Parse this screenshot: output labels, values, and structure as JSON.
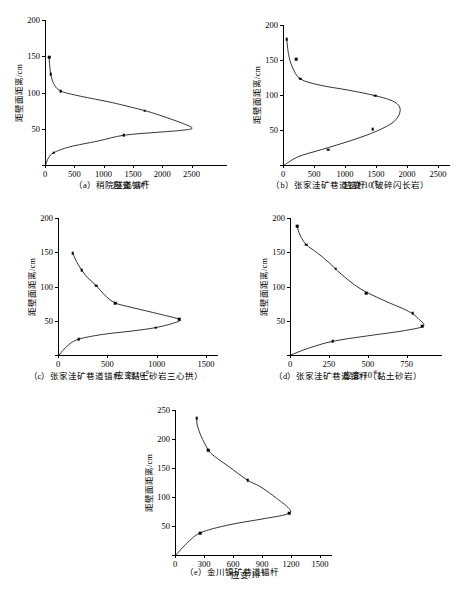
{
  "figure": {
    "axis_title_x": "应变/10",
    "axis_title_x_exp": "-6",
    "axis_title_y": "距壁面距离/cm"
  },
  "chart_data": [
    {
      "id": "a",
      "type": "scatter",
      "title": "",
      "caption": "（a）稍院隧道锚杆",
      "xlabel": "应变/10⁻⁶",
      "ylabel": "距壁面距离/cm",
      "xlim": [
        0,
        2900
      ],
      "ylim": [
        0,
        200
      ],
      "xticks": [
        0,
        500,
        1000,
        1500,
        2000,
        2500
      ],
      "yticks": [
        0,
        50,
        100,
        150,
        200
      ],
      "grid": false,
      "legend": "none",
      "points": [
        {
          "x": 70,
          "y": 149
        },
        {
          "x": 100,
          "y": 125
        },
        {
          "x": 270,
          "y": 102
        },
        {
          "x": 1700,
          "y": 75
        },
        {
          "x": 1340,
          "y": 41
        },
        {
          "x": 150,
          "y": 17
        }
      ],
      "curve": [
        {
          "x": 10,
          "y": 0
        },
        {
          "x": 60,
          "y": 10
        },
        {
          "x": 150,
          "y": 17
        },
        {
          "x": 420,
          "y": 25
        },
        {
          "x": 900,
          "y": 33
        },
        {
          "x": 1340,
          "y": 41
        },
        {
          "x": 1900,
          "y": 45
        },
        {
          "x": 2350,
          "y": 48
        },
        {
          "x": 2510,
          "y": 51
        },
        {
          "x": 2330,
          "y": 58
        },
        {
          "x": 1980,
          "y": 68
        },
        {
          "x": 1700,
          "y": 75
        },
        {
          "x": 1150,
          "y": 86
        },
        {
          "x": 600,
          "y": 95
        },
        {
          "x": 270,
          "y": 102
        },
        {
          "x": 150,
          "y": 112
        },
        {
          "x": 100,
          "y": 125
        },
        {
          "x": 80,
          "y": 137
        },
        {
          "x": 70,
          "y": 149
        }
      ]
    },
    {
      "id": "b",
      "type": "scatter",
      "title": "",
      "caption": "（b）张家洼矿巷道锚杆（破碎闪长岩）",
      "xlabel": "应变/10⁻⁶",
      "ylabel": "距壁面距离/cm",
      "xlim": [
        0,
        2500
      ],
      "ylim": [
        0,
        200
      ],
      "xticks": [
        0,
        500,
        1000,
        1500,
        2000,
        2500
      ],
      "yticks": [
        0,
        50,
        100,
        150,
        200
      ],
      "grid": false,
      "legend": "none",
      "points": [
        {
          "x": 60,
          "y": 180
        },
        {
          "x": 210,
          "y": 151
        },
        {
          "x": 280,
          "y": 123
        },
        {
          "x": 1490,
          "y": 99
        },
        {
          "x": 1450,
          "y": 51
        },
        {
          "x": 730,
          "y": 22
        }
      ],
      "curve": [
        {
          "x": 20,
          "y": 0
        },
        {
          "x": 250,
          "y": 12
        },
        {
          "x": 620,
          "y": 22
        },
        {
          "x": 1100,
          "y": 35
        },
        {
          "x": 1500,
          "y": 48
        },
        {
          "x": 1790,
          "y": 62
        },
        {
          "x": 1890,
          "y": 78
        },
        {
          "x": 1800,
          "y": 90
        },
        {
          "x": 1490,
          "y": 99
        },
        {
          "x": 1050,
          "y": 107
        },
        {
          "x": 600,
          "y": 114
        },
        {
          "x": 280,
          "y": 123
        },
        {
          "x": 150,
          "y": 140
        },
        {
          "x": 90,
          "y": 158
        },
        {
          "x": 60,
          "y": 180
        }
      ]
    },
    {
      "id": "c",
      "type": "scatter",
      "title": "",
      "caption": "（c）张家洼矿巷道锚杆（黏土砂岩三心拱）",
      "xlabel": "应变/10⁻⁶",
      "ylabel": "距壁面距离/cm",
      "xlim": [
        0,
        1500
      ],
      "ylim": [
        0,
        200
      ],
      "xticks": [
        0,
        500,
        1000,
        1500
      ],
      "yticks": [
        0,
        50,
        100,
        150,
        200
      ],
      "grid": false,
      "legend": "none",
      "points": [
        {
          "x": 150,
          "y": 149
        },
        {
          "x": 240,
          "y": 124
        },
        {
          "x": 390,
          "y": 101
        },
        {
          "x": 580,
          "y": 76
        },
        {
          "x": 1230,
          "y": 52
        },
        {
          "x": 990,
          "y": 40
        },
        {
          "x": 210,
          "y": 23
        }
      ],
      "curve": [
        {
          "x": 10,
          "y": 0
        },
        {
          "x": 100,
          "y": 14
        },
        {
          "x": 210,
          "y": 23
        },
        {
          "x": 450,
          "y": 30
        },
        {
          "x": 750,
          "y": 35
        },
        {
          "x": 990,
          "y": 40
        },
        {
          "x": 1180,
          "y": 47
        },
        {
          "x": 1230,
          "y": 52
        },
        {
          "x": 1020,
          "y": 60
        },
        {
          "x": 760,
          "y": 69
        },
        {
          "x": 580,
          "y": 76
        },
        {
          "x": 470,
          "y": 88
        },
        {
          "x": 390,
          "y": 101
        },
        {
          "x": 300,
          "y": 113
        },
        {
          "x": 240,
          "y": 124
        },
        {
          "x": 185,
          "y": 137
        },
        {
          "x": 150,
          "y": 149
        }
      ]
    },
    {
      "id": "d",
      "type": "scatter",
      "title": "",
      "caption": "（d）张家洼矿巷道锚杆（黏土砂岩）",
      "xlabel": "应变/10⁻⁶",
      "ylabel": "距壁面距离/cm",
      "xlim": [
        0,
        900
      ],
      "ylim": [
        0,
        200
      ],
      "xticks": [
        0,
        250,
        500,
        750
      ],
      "yticks": [
        0,
        50,
        100,
        150,
        200
      ],
      "grid": false,
      "legend": "none",
      "points": [
        {
          "x": 45,
          "y": 188
        },
        {
          "x": 105,
          "y": 161
        },
        {
          "x": 295,
          "y": 126
        },
        {
          "x": 490,
          "y": 90
        },
        {
          "x": 790,
          "y": 61
        },
        {
          "x": 850,
          "y": 42
        },
        {
          "x": 275,
          "y": 20
        }
      ],
      "curve": [
        {
          "x": 5,
          "y": 0
        },
        {
          "x": 120,
          "y": 10
        },
        {
          "x": 275,
          "y": 20
        },
        {
          "x": 500,
          "y": 28
        },
        {
          "x": 720,
          "y": 35
        },
        {
          "x": 855,
          "y": 42
        },
        {
          "x": 830,
          "y": 52
        },
        {
          "x": 760,
          "y": 64
        },
        {
          "x": 600,
          "y": 80
        },
        {
          "x": 450,
          "y": 97
        },
        {
          "x": 330,
          "y": 118
        },
        {
          "x": 250,
          "y": 135
        },
        {
          "x": 170,
          "y": 150
        },
        {
          "x": 105,
          "y": 161
        },
        {
          "x": 65,
          "y": 175
        },
        {
          "x": 45,
          "y": 188
        }
      ]
    },
    {
      "id": "e",
      "type": "scatter",
      "title": "",
      "caption": "（e）金川镍矿巷道锚杆",
      "xlabel": "应变/10⁻⁶",
      "ylabel": "距壁面距离/cm",
      "xlim": [
        0,
        1500
      ],
      "ylim": [
        0,
        250
      ],
      "xticks": [
        0,
        300,
        600,
        900,
        1200,
        1500
      ],
      "yticks": [
        0,
        50,
        100,
        150,
        200,
        250
      ],
      "grid": false,
      "legend": "none",
      "points": [
        {
          "x": 225,
          "y": 236
        },
        {
          "x": 345,
          "y": 181
        },
        {
          "x": 750,
          "y": 129
        },
        {
          "x": 1180,
          "y": 72
        },
        {
          "x": 260,
          "y": 38
        }
      ],
      "curve": [
        {
          "x": 10,
          "y": 0
        },
        {
          "x": 110,
          "y": 18
        },
        {
          "x": 260,
          "y": 38
        },
        {
          "x": 560,
          "y": 52
        },
        {
          "x": 900,
          "y": 62
        },
        {
          "x": 1150,
          "y": 70
        },
        {
          "x": 1190,
          "y": 78
        },
        {
          "x": 1050,
          "y": 98
        },
        {
          "x": 880,
          "y": 118
        },
        {
          "x": 750,
          "y": 129
        },
        {
          "x": 560,
          "y": 152
        },
        {
          "x": 410,
          "y": 170
        },
        {
          "x": 345,
          "y": 181
        },
        {
          "x": 270,
          "y": 205
        },
        {
          "x": 230,
          "y": 224
        },
        {
          "x": 225,
          "y": 236
        }
      ]
    }
  ]
}
